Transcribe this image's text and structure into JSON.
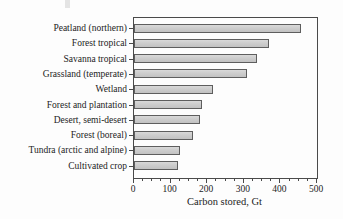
{
  "chart_data": {
    "type": "bar",
    "orientation": "horizontal",
    "title": "",
    "xlabel": "Carbon stored, Gt",
    "ylabel": "",
    "categories": [
      "Peatland (northern)",
      "Forest tropical",
      "Savanna tropical",
      "Grassland (temperate)",
      "Wetland",
      "Forest and plantation",
      "Desert, semi-desert",
      "Forest (boreal)",
      "Tundra (arctic and alpine)",
      "Cultivated crop"
    ],
    "values": [
      455,
      370,
      335,
      310,
      215,
      185,
      180,
      160,
      125,
      120
    ],
    "xlim": [
      0,
      500
    ],
    "xticks": [
      0,
      100,
      200,
      300,
      400,
      500
    ],
    "minor_tick_step": 25,
    "grid": false,
    "legend": false,
    "frame": true,
    "bar_fill": "#cdcdcd",
    "bar_border": "#5e5e5e",
    "axis_color": "#4a4a4a",
    "text_color": "#1c1c1c"
  }
}
